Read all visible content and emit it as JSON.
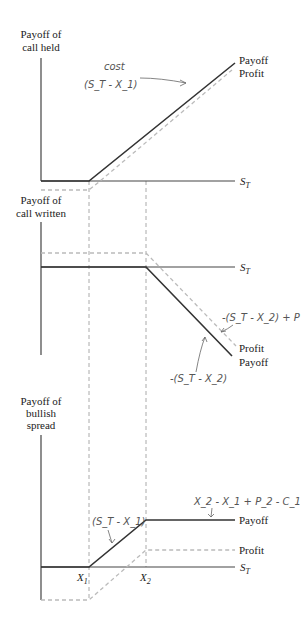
{
  "diagram": {
    "panels": [
      {
        "id": "call-held",
        "ylabel_line1": "Payoff of",
        "ylabel_line2": "call held",
        "xlabel": "S",
        "xlabel_sub": "T",
        "legend_payoff": "Payoff",
        "legend_profit": "Profit",
        "annotation": "(S_T - X_1)",
        "annotation_small": "cost"
      },
      {
        "id": "call-written",
        "ylabel_line1": "Payoff of",
        "ylabel_line2": "call written",
        "xlabel": "S",
        "xlabel_sub": "T",
        "legend_profit": "Profit",
        "legend_payoff": "Payoff",
        "annotation_profit": "-(S_T - X_2) + P",
        "annotation_payoff": "-(S_T - X_2)"
      },
      {
        "id": "bullish-spread",
        "ylabel_line1": "Payoff of",
        "ylabel_line2": "bullish",
        "ylabel_line3": "spread",
        "xlabel": "S",
        "xlabel_sub": "T",
        "legend_payoff": "Payoff",
        "legend_profit": "Profit",
        "annotation_slope": "(S_T - X_1)",
        "annotation_cap": "X_2 - X_1 + P_2 - C_1",
        "x1_label": "X",
        "x1_sub": "1",
        "x2_label": "X",
        "x2_sub": "2"
      }
    ]
  },
  "colors": {
    "payoff_line": "#333333",
    "profit_line": "#bbbbbb",
    "guide_line": "#aaaaaa",
    "handwriting": "#555555"
  }
}
